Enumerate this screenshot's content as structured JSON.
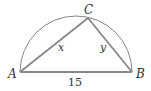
{
  "diagram": {
    "points": {
      "A": {
        "label": "A",
        "x": 20,
        "y": 72
      },
      "B": {
        "label": "B",
        "x": 132,
        "y": 72
      },
      "C": {
        "label": "C",
        "x": 88,
        "y": 18
      }
    },
    "sides": {
      "AB": {
        "label": "15"
      },
      "AC": {
        "label": "x"
      },
      "BC": {
        "label": "y"
      }
    },
    "colors": {
      "triangle": "#888888",
      "arc": "#777777",
      "text": "#333333"
    }
  }
}
